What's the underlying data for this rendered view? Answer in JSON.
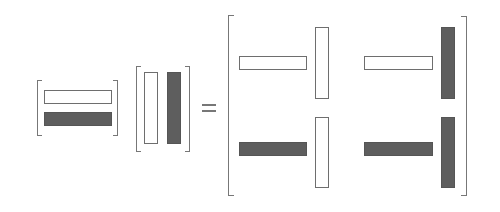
{
  "diagram": {
    "operator": "=",
    "colors": {
      "white_block": "#ffffff",
      "dark_block": "#5e5e5e",
      "outline": "#6e6e6e"
    },
    "left_matrix": {
      "shape": "2x1",
      "entries": [
        {
          "type": "horizontal-bar",
          "fill": "white"
        },
        {
          "type": "horizontal-bar",
          "fill": "dark"
        }
      ]
    },
    "right_matrix": {
      "shape": "1x2",
      "entries": [
        {
          "type": "vertical-bar",
          "fill": "white"
        },
        {
          "type": "vertical-bar",
          "fill": "dark"
        }
      ]
    },
    "result_matrix": {
      "shape": "2x2",
      "cells": [
        {
          "row": 0,
          "col": 0,
          "horizontal": "white",
          "vertical": "white"
        },
        {
          "row": 0,
          "col": 1,
          "horizontal": "white",
          "vertical": "dark"
        },
        {
          "row": 1,
          "col": 0,
          "horizontal": "dark",
          "vertical": "white"
        },
        {
          "row": 1,
          "col": 1,
          "horizontal": "dark",
          "vertical": "dark"
        }
      ]
    }
  }
}
